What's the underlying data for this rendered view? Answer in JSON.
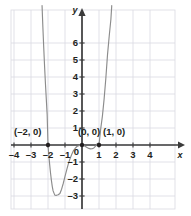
{
  "figure": {
    "axis_labels": {
      "x": "x",
      "y": "y"
    },
    "origin_label": "0"
  },
  "chart_data": {
    "type": "line",
    "title": "",
    "xlabel": "x",
    "ylabel": "y",
    "xlim": [
      -4.6,
      4.8
    ],
    "ylim": [
      -3.4,
      6.8
    ],
    "xticks": [
      -4,
      -3,
      -2,
      -1,
      1,
      2,
      3,
      4
    ],
    "xticklabels": [
      "-4",
      "-3",
      "-2",
      "-1",
      "1",
      "2",
      "3",
      "4"
    ],
    "yticks": [
      -3,
      -2,
      -1,
      1,
      2,
      3,
      4,
      5,
      6
    ],
    "yticklabels": [
      "-3",
      "-2",
      "-1",
      "1",
      "2",
      "3",
      "4",
      "5",
      "6"
    ],
    "grid": true,
    "grid_color": "#d9d9e2",
    "legend": "none",
    "curve_color": "#8c8c8c",
    "marker_color": "#231f20",
    "axis_color": "#3b3b3b",
    "series": [
      {
        "name": "polynomial",
        "x": [
          -2.35,
          -2.3,
          -2.25,
          -2.2,
          -2.15,
          -2.1,
          -2.05,
          -2.0,
          -1.95,
          -1.9,
          -1.85,
          -1.8,
          -1.75,
          -1.7,
          -1.6,
          -1.5,
          -1.4,
          -1.3,
          -1.2,
          -1.1,
          -1.0,
          -0.9,
          -0.8,
          -0.7,
          -0.6,
          -0.5,
          -0.4,
          -0.3,
          -0.2,
          -0.1,
          0.0,
          0.1,
          0.2,
          0.3,
          0.4,
          0.5,
          0.6,
          0.7,
          0.8,
          0.9,
          1.0,
          1.1,
          1.2,
          1.3,
          1.4,
          1.5,
          1.6,
          1.7,
          1.75
        ],
        "y": [
          8.2,
          6.9,
          5.7,
          4.6,
          3.6,
          2.7,
          1.8,
          0.0,
          -0.62,
          -1.17,
          -1.66,
          -2.08,
          -2.43,
          -2.7,
          -2.95,
          -2.96,
          -2.93,
          -2.85,
          -2.6,
          -2.25,
          -1.85,
          -1.46,
          -1.1,
          -0.79,
          -0.54,
          -0.33,
          -0.19,
          -0.09,
          -0.04,
          -0.01,
          0.0,
          -0.03,
          -0.09,
          -0.15,
          -0.2,
          -0.23,
          -0.22,
          -0.17,
          -0.07,
          0.09,
          0.0,
          0.95,
          1.7,
          2.7,
          3.9,
          5.3,
          6.4,
          7.4,
          8.2
        ]
      }
    ],
    "points": [
      {
        "x": -2,
        "y": 0,
        "label": "(–2, 0)",
        "label_dx": -34,
        "label_dy": -18
      },
      {
        "x": 0,
        "y": 0,
        "label": "(0, 0)",
        "label_dx": -4,
        "label_dy": -18
      },
      {
        "x": 1,
        "y": 0,
        "label": "(1, 0)",
        "label_dx": 4,
        "label_dy": -18
      }
    ]
  }
}
